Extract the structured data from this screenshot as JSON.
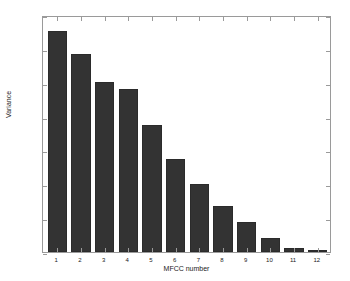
{
  "chart_data": {
    "type": "bar",
    "title": "",
    "xlabel": "MFCC number",
    "ylabel": "Variance",
    "categories": [
      "1",
      "2",
      "3",
      "4",
      "5",
      "6",
      "7",
      "8",
      "9",
      "10",
      "11",
      "12"
    ],
    "values": [
      652,
      585,
      503,
      482,
      376,
      275,
      201,
      136,
      88,
      41,
      12,
      2
    ],
    "ylim": [
      0,
      700
    ],
    "yticks": [
      0,
      100,
      200,
      300,
      400,
      500,
      600,
      700
    ],
    "ytick_labels": [
      "0",
      "100",
      "200",
      "300",
      "400",
      "500",
      "600",
      "700"
    ],
    "xlim": [
      0.4,
      12.6
    ],
    "grid": false,
    "legend": null,
    "bar_color": "#333333",
    "axis_color": "#9a9a9a",
    "background": "#ffffff"
  }
}
